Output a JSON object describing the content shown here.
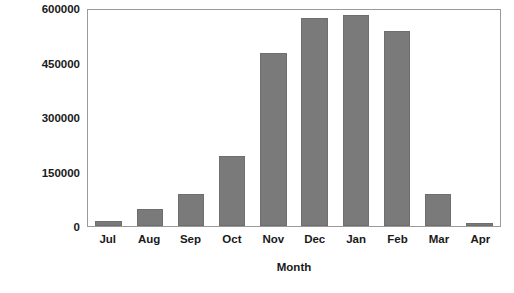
{
  "chart_data": {
    "type": "bar",
    "title": "",
    "xlabel": "Month",
    "ylabel": "Cumulative WeBS total",
    "categories": [
      "Jul",
      "Aug",
      "Sep",
      "Oct",
      "Nov",
      "Dec",
      "Jan",
      "Feb",
      "Mar",
      "Apr"
    ],
    "values": [
      14000,
      47000,
      89000,
      194000,
      475000,
      572000,
      580000,
      538000,
      89000,
      9000
    ],
    "ylim": [
      0,
      600000
    ],
    "yticks": [
      0,
      150000,
      300000,
      450000,
      600000
    ],
    "ytick_labels": [
      "0",
      "150000",
      "300000",
      "450000",
      "600000"
    ],
    "grid": false,
    "legend": null,
    "bar_color": "#7a7a7a",
    "frame_color": "#9a9a9a",
    "background": "#ffffff"
  }
}
